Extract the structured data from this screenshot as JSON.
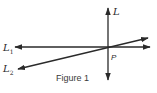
{
  "figure": {
    "caption": "Figure 1",
    "lines": [
      {
        "id": "L",
        "label": "L",
        "subscript": "",
        "x1": 108,
        "y1": 8,
        "x2": 108,
        "y2": 80
      },
      {
        "id": "L1",
        "label": "L",
        "subscript": "1",
        "x1": 15,
        "y1": 47,
        "x2": 150,
        "y2": 47
      },
      {
        "id": "L2",
        "label": "L",
        "subscript": "2",
        "x1": 18,
        "y1": 69,
        "x2": 148,
        "y2": 38
      }
    ],
    "point": {
      "label": "P",
      "x": 107,
      "y": 47
    },
    "colors": {
      "stroke": "#2a2a2a",
      "background": "#ffffff"
    }
  }
}
